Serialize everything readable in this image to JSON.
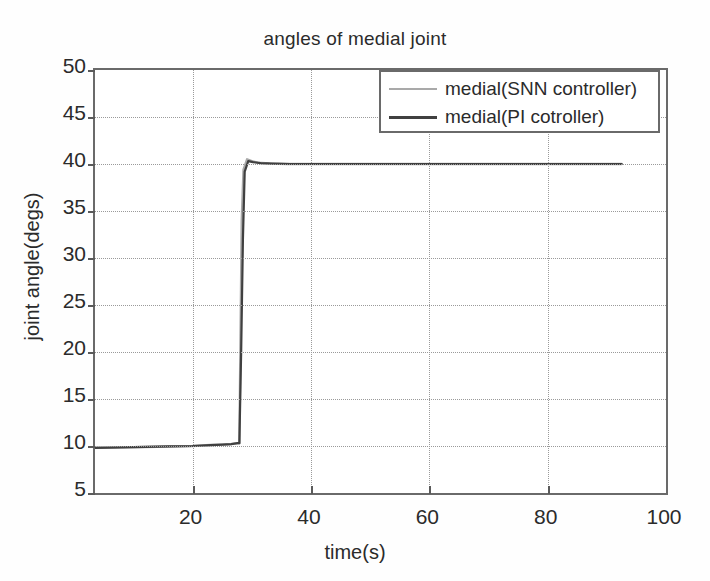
{
  "chart_data": {
    "type": "line",
    "title": "angles of medial joint",
    "xlabel": "time(s)",
    "ylabel": "joint angle(degs)",
    "xlim": [
      3.5,
      100
    ],
    "ylim": [
      5,
      50
    ],
    "xticks": [
      20,
      40,
      60,
      80,
      100
    ],
    "yticks": [
      5,
      10,
      15,
      20,
      25,
      30,
      35,
      40,
      45,
      50
    ],
    "grid": true,
    "legend_position": "top-right",
    "series": [
      {
        "name": "medial(SNN controller)",
        "color": "#a9a9a9",
        "x": [
          3.5,
          8,
          12,
          16,
          20,
          23,
          25,
          26.5,
          27.6,
          27.9,
          28.1,
          28.3,
          28.6,
          29.2,
          30,
          31,
          33,
          36,
          40,
          50,
          60,
          70,
          80,
          88,
          92.5
        ],
        "y": [
          9.8,
          9.85,
          9.9,
          9.95,
          10.0,
          10.1,
          10.15,
          10.2,
          10.3,
          10.3,
          22,
          34,
          39.4,
          40.5,
          40.3,
          40.15,
          40.05,
          40.0,
          40.0,
          40.0,
          40.0,
          40.0,
          40.0,
          40.0,
          40.0
        ]
      },
      {
        "name": "medial(PI cotroller)",
        "color": "#404040",
        "x": [
          3.5,
          8,
          12,
          16,
          20,
          23,
          25,
          26.5,
          27.6,
          27.9,
          28.2,
          28.5,
          28.8,
          29.4,
          30.2,
          31.5,
          33.5,
          36.5,
          40,
          50,
          60,
          70,
          80,
          88,
          92.5
        ],
        "y": [
          9.8,
          9.85,
          9.9,
          9.95,
          10.0,
          10.1,
          10.15,
          10.2,
          10.3,
          10.3,
          20,
          32,
          39.2,
          40.3,
          40.2,
          40.1,
          40.05,
          40.0,
          40.0,
          40.0,
          40.0,
          40.0,
          40.0,
          40.0,
          40.0
        ]
      }
    ]
  },
  "legend": {
    "entries": [
      {
        "label": "medial(SNN controller)",
        "color": "#a9a9a9"
      },
      {
        "label": "medial(PI cotroller)",
        "color": "#404040"
      }
    ]
  },
  "axis": {
    "x_tick_labels": [
      "20",
      "40",
      "60",
      "80",
      "100"
    ],
    "y_tick_labels": [
      "50",
      "45",
      "40",
      "35",
      "30",
      "25",
      "20",
      "15",
      "10",
      "5"
    ]
  }
}
